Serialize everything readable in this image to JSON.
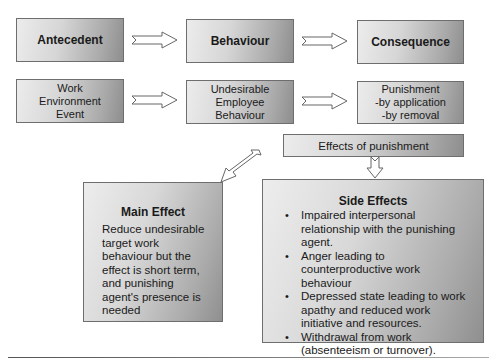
{
  "diagram": {
    "row1": {
      "antecedent": "Antecedent",
      "behaviour": "Behaviour",
      "consequence": "Consequence"
    },
    "row2": {
      "antecedent_lines": [
        "Work",
        "Environment",
        "Event"
      ],
      "behaviour_lines": [
        "Undesirable",
        "Employee",
        "Behaviour"
      ],
      "consequence_lines": [
        "Punishment",
        "-by application",
        "-by removal"
      ]
    },
    "effects_label": "Effects of punishment",
    "main_effect": {
      "title": "Main Effect",
      "body": "Reduce undesirable target work behaviour but the effect is short term, and punishing agent's presence is needed"
    },
    "side_effects": {
      "title": "Side Effects",
      "items": [
        "Impaired interpersonal relationship with the punishing agent.",
        "Anger leading to counterproductive work behaviour",
        "Depressed state leading to work apathy and reduced work initiative and resources.",
        "Withdrawal from work (absenteeism or turnover)."
      ]
    },
    "colors": {
      "box_light": "#ececec",
      "box_dark": "#8e8e8e",
      "border": "#6e6e6e",
      "text": "#1a1a1a"
    }
  }
}
